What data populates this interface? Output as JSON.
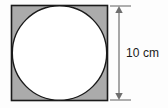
{
  "figure": {
    "type": "geometry-diagram",
    "square": {
      "name": "shaded-square",
      "fill_color": "#ababab",
      "stroke_color": "#1a1a1a",
      "stroke_width": 1.6,
      "x": 11.5,
      "y": 5.5,
      "width": 96,
      "height": 95,
      "side_length_label": "10 cm"
    },
    "circle": {
      "name": "inscribed-circle",
      "fill_color": "#ffffff",
      "stroke_color": "#1a1a1a",
      "stroke_width": 1.4,
      "center_x": 59.5,
      "center_y": 53,
      "radius": 47.2,
      "diameter_label": "10 cm"
    },
    "dimension": {
      "name": "height-dimension",
      "label": "10 cm",
      "line_x": 119,
      "top_y": 6,
      "bottom_y": 100,
      "tick_left_x": 110,
      "tick_right_x": 131,
      "color": "#6e6e6e",
      "arrowheads": "both"
    },
    "background_color": "#fdfdfd"
  }
}
